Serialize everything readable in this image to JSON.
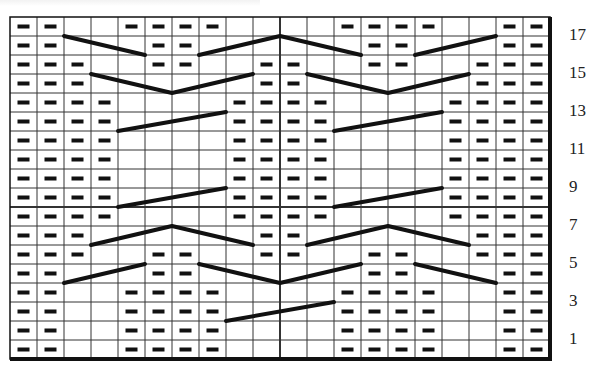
{
  "chart": {
    "title": "",
    "type": "knitting-chart",
    "columns": 20,
    "rows": 18,
    "grid": {
      "left": 10,
      "top": 17,
      "cell_w": 27,
      "cell_h": 19
    },
    "colors": {
      "line": "#111111",
      "background": "#ffffff",
      "purl": "#111111",
      "label": "#222222"
    },
    "row_labels": [
      {
        "row": 17,
        "text": "17"
      },
      {
        "row": 15,
        "text": "15"
      },
      {
        "row": 13,
        "text": "13"
      },
      {
        "row": 11,
        "text": "11"
      },
      {
        "row": 9,
        "text": "9"
      },
      {
        "row": 7,
        "text": "7"
      },
      {
        "row": 5,
        "text": "5"
      },
      {
        "row": 3,
        "text": "3"
      },
      {
        "row": 1,
        "text": "1"
      }
    ],
    "purls": {
      "18": [
        1,
        2,
        5,
        6,
        7,
        8,
        13,
        14,
        15,
        16,
        19,
        20
      ],
      "17": [
        1,
        2,
        6,
        7,
        14,
        15,
        19,
        20
      ],
      "16": [
        1,
        2,
        3,
        6,
        7,
        10,
        11,
        14,
        15,
        18,
        19,
        20
      ],
      "15": [
        1,
        2,
        3,
        10,
        11,
        18,
        19,
        20
      ],
      "14": [
        1,
        2,
        3,
        4,
        9,
        10,
        11,
        12,
        17,
        18,
        19,
        20
      ],
      "13": [
        1,
        2,
        3,
        4,
        9,
        10,
        11,
        12,
        17,
        18,
        19,
        20
      ],
      "12": [
        1,
        2,
        3,
        4,
        9,
        10,
        11,
        12,
        17,
        18,
        19,
        20
      ],
      "11": [
        1,
        2,
        3,
        4,
        9,
        10,
        11,
        12,
        17,
        18,
        19,
        20
      ],
      "10": [
        1,
        2,
        3,
        4,
        9,
        10,
        11,
        12,
        17,
        18,
        19,
        20
      ],
      "9": [
        1,
        2,
        3,
        4,
        9,
        10,
        11,
        12,
        17,
        18,
        19,
        20
      ],
      "8": [
        1,
        2,
        3,
        4,
        9,
        10,
        11,
        12,
        17,
        18,
        19,
        20
      ],
      "7": [
        1,
        2,
        3,
        10,
        11,
        18,
        19,
        20
      ],
      "6": [
        1,
        2,
        3,
        6,
        7,
        10,
        11,
        14,
        15,
        18,
        19,
        20
      ],
      "5": [
        1,
        2,
        6,
        7,
        14,
        15,
        19,
        20
      ],
      "4": [
        1,
        2,
        5,
        6,
        7,
        8,
        13,
        14,
        15,
        16,
        19,
        20
      ],
      "3": [
        1,
        2,
        5,
        6,
        7,
        8,
        13,
        14,
        15,
        16,
        19,
        20
      ],
      "2": [
        1,
        2,
        5,
        6,
        7,
        8,
        13,
        14,
        15,
        16,
        19,
        20
      ],
      "1": [
        1,
        2,
        5,
        6,
        7,
        8,
        13,
        14,
        15,
        16,
        19,
        20
      ]
    },
    "cables": [
      {
        "row": 17,
        "points": [
          [
            2,
            0
          ],
          [
            5,
            1
          ]
        ]
      },
      {
        "row": 17,
        "points": [
          [
            7,
            1
          ],
          [
            10,
            0
          ],
          [
            13,
            1
          ]
        ]
      },
      {
        "row": 17,
        "points": [
          [
            15,
            1
          ],
          [
            18,
            0
          ]
        ]
      },
      {
        "row": 15,
        "points": [
          [
            3,
            0
          ],
          [
            6,
            1
          ],
          [
            9,
            0
          ]
        ]
      },
      {
        "row": 15,
        "points": [
          [
            11,
            0
          ],
          [
            14,
            1
          ],
          [
            17,
            0
          ]
        ]
      },
      {
        "row": 13,
        "points": [
          [
            4,
            1
          ],
          [
            8,
            0
          ]
        ]
      },
      {
        "row": 13,
        "points": [
          [
            12,
            1
          ],
          [
            16,
            0
          ]
        ]
      },
      {
        "row": 9,
        "points": [
          [
            4,
            1
          ],
          [
            8,
            0
          ]
        ]
      },
      {
        "row": 9,
        "points": [
          [
            12,
            1
          ],
          [
            16,
            0
          ]
        ]
      },
      {
        "row": 7,
        "points": [
          [
            3,
            1
          ],
          [
            6,
            0
          ],
          [
            9,
            1
          ]
        ]
      },
      {
        "row": 7,
        "points": [
          [
            11,
            1
          ],
          [
            14,
            0
          ],
          [
            17,
            1
          ]
        ]
      },
      {
        "row": 5,
        "points": [
          [
            2,
            1
          ],
          [
            5,
            0
          ]
        ]
      },
      {
        "row": 5,
        "points": [
          [
            7,
            0
          ],
          [
            10,
            1
          ],
          [
            13,
            0
          ]
        ]
      },
      {
        "row": 5,
        "points": [
          [
            15,
            0
          ],
          [
            18,
            1
          ]
        ]
      },
      {
        "row": 3,
        "points": [
          [
            8,
            1
          ],
          [
            12,
            0
          ]
        ]
      }
    ],
    "thick_lines": {
      "vertical_after_col": 10,
      "horizontal_below_row": 9
    }
  },
  "chart_data": {
    "type": "table",
    "title": "",
    "row_labels": [
      "1",
      "3",
      "5",
      "7",
      "9",
      "11",
      "13",
      "15",
      "17"
    ],
    "columns": 20,
    "rows": 18
  }
}
